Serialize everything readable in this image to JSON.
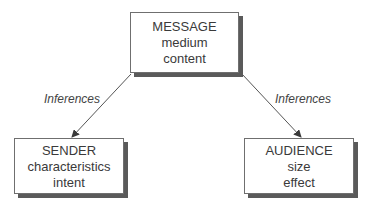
{
  "nodes": {
    "message": {
      "title": "MESSAGE",
      "lines": [
        "medium",
        "content"
      ]
    },
    "sender": {
      "title": "SENDER",
      "lines": [
        "characteristics",
        "intent"
      ]
    },
    "audience": {
      "title": "AUDIENCE",
      "lines": [
        "size",
        "effect"
      ]
    }
  },
  "edges": {
    "to_sender": {
      "from": "MESSAGE",
      "to": "SENDER",
      "label": "Inferences"
    },
    "to_audience": {
      "from": "MESSAGE",
      "to": "AUDIENCE",
      "label": "Inferences"
    }
  }
}
